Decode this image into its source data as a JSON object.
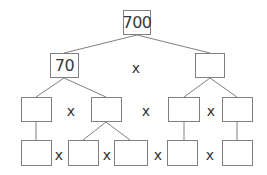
{
  "colors": {
    "line": "#808080",
    "text": "#333333",
    "background": "#ffffff"
  },
  "nodes": [
    {
      "id": "root",
      "value": "700",
      "x": 123,
      "y": 10,
      "w": 28,
      "h": 25
    },
    {
      "id": "l1-left",
      "value": "70",
      "x": 50,
      "y": 53,
      "w": 29,
      "h": 25
    },
    {
      "id": "l1-right",
      "value": "",
      "x": 195,
      "y": 53,
      "w": 30,
      "h": 25
    },
    {
      "id": "l2-a",
      "value": "",
      "x": 21,
      "y": 97,
      "w": 31,
      "h": 25
    },
    {
      "id": "l2-b",
      "value": "",
      "x": 91,
      "y": 97,
      "w": 31,
      "h": 25
    },
    {
      "id": "l2-c",
      "value": "",
      "x": 168,
      "y": 97,
      "w": 32,
      "h": 25
    },
    {
      "id": "l2-d",
      "value": "",
      "x": 222,
      "y": 97,
      "w": 31,
      "h": 25
    },
    {
      "id": "l3-a",
      "value": "",
      "x": 21,
      "y": 140,
      "w": 31,
      "h": 26
    },
    {
      "id": "l3-b",
      "value": "",
      "x": 68,
      "y": 140,
      "w": 31,
      "h": 26
    },
    {
      "id": "l3-c",
      "value": "",
      "x": 114,
      "y": 140,
      "w": 34,
      "h": 26
    },
    {
      "id": "l3-d",
      "value": "",
      "x": 167,
      "y": 140,
      "w": 31,
      "h": 26
    },
    {
      "id": "l3-e",
      "value": "",
      "x": 222,
      "y": 140,
      "w": 31,
      "h": 26
    }
  ],
  "operators": [
    {
      "symbol": "x",
      "x": 136,
      "y": 68
    },
    {
      "symbol": "x",
      "x": 71,
      "y": 111
    },
    {
      "symbol": "x",
      "x": 146,
      "y": 111
    },
    {
      "symbol": "x",
      "x": 211,
      "y": 111
    },
    {
      "symbol": "x",
      "x": 59,
      "y": 155
    },
    {
      "symbol": "x",
      "x": 107,
      "y": 155
    },
    {
      "symbol": "x",
      "x": 158,
      "y": 155
    },
    {
      "symbol": "x",
      "x": 210,
      "y": 155
    }
  ],
  "edges": [
    {
      "from": "root",
      "to": "l1-left",
      "x1": 137,
      "y1": 35,
      "x2": 64,
      "y2": 53
    },
    {
      "from": "root",
      "to": "l1-right",
      "x1": 137,
      "y1": 35,
      "x2": 210,
      "y2": 53
    },
    {
      "from": "l1-left",
      "to": "l2-a",
      "x1": 64,
      "y1": 78,
      "x2": 36,
      "y2": 97
    },
    {
      "from": "l1-left",
      "to": "l2-b",
      "x1": 64,
      "y1": 78,
      "x2": 106,
      "y2": 97
    },
    {
      "from": "l1-right",
      "to": "l2-c",
      "x1": 210,
      "y1": 78,
      "x2": 184,
      "y2": 97
    },
    {
      "from": "l1-right",
      "to": "l2-d",
      "x1": 210,
      "y1": 78,
      "x2": 237,
      "y2": 97
    },
    {
      "from": "l2-a",
      "to": "l3-a",
      "x1": 36,
      "y1": 122,
      "x2": 36,
      "y2": 140
    },
    {
      "from": "l2-b",
      "to": "l3-b",
      "x1": 106,
      "y1": 122,
      "x2": 83,
      "y2": 140
    },
    {
      "from": "l2-b",
      "to": "l3-c",
      "x1": 106,
      "y1": 122,
      "x2": 130,
      "y2": 140
    },
    {
      "from": "l2-c",
      "to": "l3-d",
      "x1": 184,
      "y1": 122,
      "x2": 184,
      "y2": 140
    },
    {
      "from": "l2-d",
      "to": "l3-e",
      "x1": 237,
      "y1": 122,
      "x2": 237,
      "y2": 140
    }
  ]
}
